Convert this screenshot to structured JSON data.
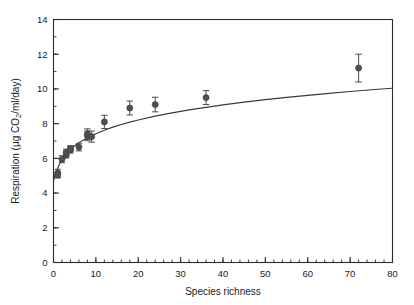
{
  "chart_data": {
    "type": "scatter",
    "title": "",
    "xlabel": "Species richness",
    "ylabel": "Respiration (µg CO₂/ml/day)",
    "xlim": [
      0,
      80
    ],
    "ylim": [
      0,
      14
    ],
    "xticks": [
      0,
      10,
      20,
      30,
      40,
      50,
      60,
      70,
      80
    ],
    "yticks": [
      0,
      2,
      4,
      6,
      8,
      10,
      12,
      14
    ],
    "x_minor_step": 2,
    "y_minor_step": 1,
    "grid": false,
    "legend": "none",
    "marker_color": "#4f4f4f",
    "line_color": "#3a3a3a",
    "series": [
      {
        "name": "Respiration vs species richness",
        "points": [
          {
            "x": 1,
            "y": 5.15,
            "err": 0.22
          },
          {
            "x": 1,
            "y": 5.05,
            "err": 0.18
          },
          {
            "x": 2,
            "y": 5.95,
            "err": 0.2
          },
          {
            "x": 3,
            "y": 6.2,
            "err": 0.18
          },
          {
            "x": 3,
            "y": 6.35,
            "err": 0.18
          },
          {
            "x": 4,
            "y": 6.5,
            "err": 0.2
          },
          {
            "x": 4,
            "y": 6.55,
            "err": 0.18
          },
          {
            "x": 6,
            "y": 6.65,
            "err": 0.22
          },
          {
            "x": 8,
            "y": 7.3,
            "err": 0.28
          },
          {
            "x": 8,
            "y": 7.4,
            "err": 0.3
          },
          {
            "x": 9,
            "y": 7.25,
            "err": 0.32
          },
          {
            "x": 12,
            "y": 8.1,
            "err": 0.38
          },
          {
            "x": 18,
            "y": 8.9,
            "err": 0.4
          },
          {
            "x": 24,
            "y": 9.1,
            "err": 0.42
          },
          {
            "x": 36,
            "y": 9.5,
            "err": 0.4
          },
          {
            "x": 72,
            "y": 11.2,
            "err": 0.8
          }
        ]
      }
    ],
    "fit_curve": {
      "description": "saturating logarithmic fit",
      "points": [
        {
          "x": 0.0,
          "y": 4.7
        },
        {
          "x": 0.5,
          "y": 5.1
        },
        {
          "x": 1.0,
          "y": 5.45
        },
        {
          "x": 1.5,
          "y": 5.72
        },
        {
          "x": 2.0,
          "y": 5.95
        },
        {
          "x": 2.5,
          "y": 6.12
        },
        {
          "x": 3.0,
          "y": 6.28
        },
        {
          "x": 4.0,
          "y": 6.52
        },
        {
          "x": 5.0,
          "y": 6.73
        },
        {
          "x": 6.0,
          "y": 6.9
        },
        {
          "x": 7.0,
          "y": 7.05
        },
        {
          "x": 8.0,
          "y": 7.19
        },
        {
          "x": 9.0,
          "y": 7.31
        },
        {
          "x": 10.0,
          "y": 7.42
        },
        {
          "x": 12.0,
          "y": 7.62
        },
        {
          "x": 14.0,
          "y": 7.8
        },
        {
          "x": 16.0,
          "y": 7.95
        },
        {
          "x": 18.0,
          "y": 8.09
        },
        {
          "x": 20.0,
          "y": 8.21
        },
        {
          "x": 24.0,
          "y": 8.43
        },
        {
          "x": 28.0,
          "y": 8.62
        },
        {
          "x": 32.0,
          "y": 8.79
        },
        {
          "x": 36.0,
          "y": 8.94
        },
        {
          "x": 40.0,
          "y": 9.08
        },
        {
          "x": 45.0,
          "y": 9.24
        },
        {
          "x": 50.0,
          "y": 9.38
        },
        {
          "x": 55.0,
          "y": 9.51
        },
        {
          "x": 60.0,
          "y": 9.63
        },
        {
          "x": 65.0,
          "y": 9.74
        },
        {
          "x": 70.0,
          "y": 9.85
        },
        {
          "x": 75.0,
          "y": 9.95
        },
        {
          "x": 80.0,
          "y": 10.04
        }
      ]
    }
  }
}
